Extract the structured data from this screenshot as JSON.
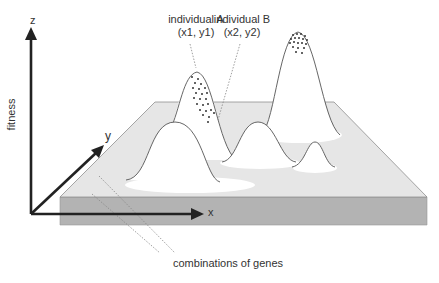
{
  "diagram": {
    "axes": {
      "z_label": "z",
      "fitness_label": "fitness",
      "y_label": "y",
      "x_label": "x"
    },
    "annotations": {
      "individual_a_name": "individual A",
      "individual_a_coords": "(x1, y1)",
      "individual_b_name": "individual B",
      "individual_b_coords": "(x2, y2)",
      "combinations": "combinations of genes"
    },
    "colors": {
      "slab_top": "#e6e6e6",
      "slab_front": "#b3b3b3",
      "slab_edge": "#8f8f8f",
      "axis": "#222222",
      "peak_fill": "#ffffff",
      "peak_outline": "#555555",
      "dots": "#333333",
      "dotted_line": "#888888"
    }
  }
}
